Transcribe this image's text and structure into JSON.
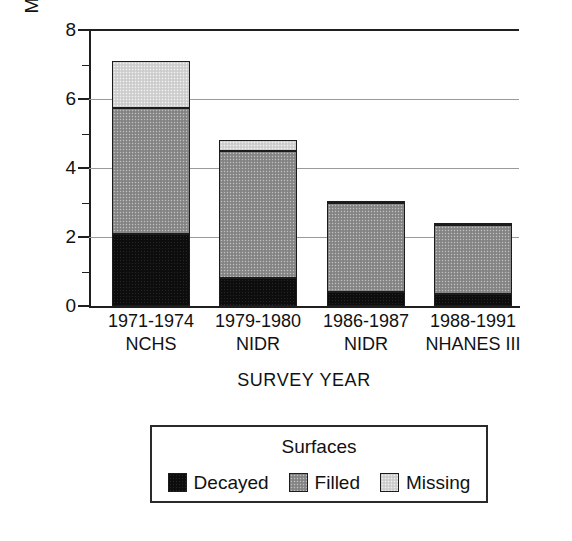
{
  "chart_data": {
    "type": "bar",
    "subtype": "stacked-bar",
    "title": "",
    "xlabel": "SURVEY YEAR",
    "ylabel": "Mean surfaces",
    "ylim": [
      0,
      8
    ],
    "yticks": [
      0,
      2,
      4,
      6,
      8
    ],
    "ytick_labels": [
      "0",
      "2",
      "4",
      "6",
      "8"
    ],
    "y_minor_ticks": [
      1,
      3,
      5,
      7
    ],
    "grid": true,
    "grid_axis": "y",
    "legend_position": "below-axes",
    "categories": [
      "1971-1974",
      "1979-1980",
      "1986-1987",
      "1988-1991"
    ],
    "category_sublabels": [
      "NCHS",
      "NIDR",
      "NIDR",
      "NHANES III"
    ],
    "series": [
      {
        "name": "Decayed",
        "color": "#0d0d0d",
        "values": [
          2.1,
          0.8,
          0.4,
          0.35
        ]
      },
      {
        "name": "Filled",
        "color": "#8d8d8d",
        "values": [
          3.65,
          3.7,
          2.6,
          2.0
        ]
      },
      {
        "name": "Missing",
        "color": "#d5d5d5",
        "values": [
          1.35,
          0.3,
          0.05,
          0.05
        ]
      }
    ],
    "totals": [
      7.1,
      4.8,
      3.05,
      2.4
    ],
    "legend_title": "Surfaces",
    "legend_entries": [
      "Decayed",
      "Filled",
      "Missing"
    ]
  },
  "axes": {
    "y_title": "Mean surfaces",
    "x_title": "SURVEY YEAR"
  },
  "legend": {
    "title": "Surfaces",
    "items": [
      {
        "label": "Decayed",
        "color": "#0d0d0d"
      },
      {
        "label": "Filled",
        "color": "#8d8d8d"
      },
      {
        "label": "Missing",
        "color": "#d5d5d5"
      }
    ]
  }
}
